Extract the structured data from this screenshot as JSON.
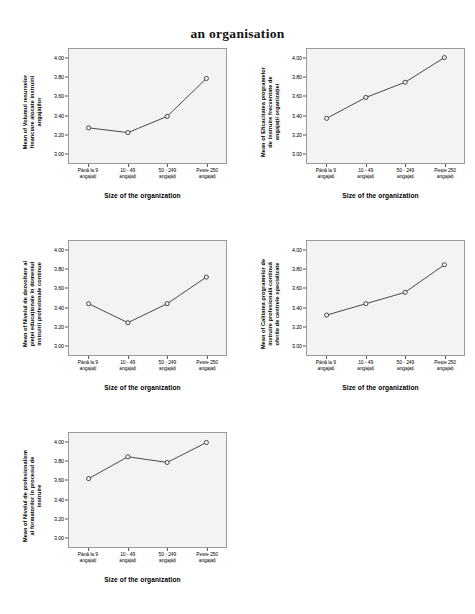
{
  "title": "an organisation",
  "common": {
    "xlabel": "Size of the organization",
    "categories": [
      [
        "Până la 9",
        "angajați"
      ],
      [
        "10 - 49",
        "angajați"
      ],
      [
        "50 - 249",
        "angajați"
      ],
      [
        "Peste 250",
        "angajați"
      ]
    ],
    "categories_flat": [
      "Până la 9 angajați",
      "10 - 49 angajați",
      "50 - 249 angajați",
      "Peste 250 angajați"
    ],
    "yticks": [
      "3.00",
      "3.20",
      "3.40",
      "3.60",
      "3.80",
      "4.00"
    ],
    "ylim": [
      2.9,
      4.1
    ]
  },
  "chart_data": [
    {
      "type": "line",
      "id": "panel-1",
      "title": "",
      "ylabel": "Mean of Volumul resurselor financiare alocate instruirii angajaților",
      "ylabel_lines": [
        "Mean of Volumul resurselor",
        "financiare alocate instruirii",
        "angajaților"
      ],
      "xlabel": "Size of the organization",
      "categories": [
        "Până la 9 angajați",
        "10 - 49 angajați",
        "50 - 249 angajați",
        "Peste 250 angajați"
      ],
      "values": [
        3.27,
        3.22,
        3.39,
        3.79
      ],
      "ylim": [
        2.9,
        4.1
      ],
      "yticks": [
        3.0,
        3.2,
        3.4,
        3.6,
        3.8,
        4.0
      ],
      "grid": false,
      "legend": "none",
      "marker": "open-circle"
    },
    {
      "type": "line",
      "id": "panel-2",
      "title": "",
      "ylabel": "Mean of Eficacitatea programelor de instruire frecventate de angajații organizației",
      "ylabel_lines": [
        "Mean of Eficacitatea programelor",
        "de instruire frecventate de",
        "angajații organizației"
      ],
      "xlabel": "Size of the organization",
      "categories": [
        "Până la 9 angajați",
        "10 - 49 angajați",
        "50 - 249 angajați",
        "Peste 250 angajați"
      ],
      "values": [
        3.37,
        3.59,
        3.75,
        4.01
      ],
      "ylim": [
        2.9,
        4.1
      ],
      "yticks": [
        3.0,
        3.2,
        3.4,
        3.6,
        3.8,
        4.0
      ],
      "grid": false,
      "legend": "none",
      "marker": "open-circle"
    },
    {
      "type": "line",
      "id": "panel-3",
      "title": "",
      "ylabel": "Mean of Nivelul de dezvoltare al pieței educaționale în domeniul instruirii profesionale continue",
      "ylabel_lines": [
        "Mean of Nivelul de dezvoltare al",
        "pieței educaționale în domeniul",
        "instruirii profesionale continue"
      ],
      "xlabel": "Size of the organization",
      "categories": [
        "Până la 9 angajați",
        "10 - 49 angajați",
        "50 - 249 angajați",
        "Peste 250 angajați"
      ],
      "values": [
        3.44,
        3.24,
        3.44,
        3.72
      ],
      "ylim": [
        2.9,
        4.1
      ],
      "yticks": [
        3.0,
        3.2,
        3.4,
        3.6,
        3.8,
        4.0
      ],
      "grid": false,
      "legend": "none",
      "marker": "open-circle"
    },
    {
      "type": "line",
      "id": "panel-4",
      "title": "",
      "ylabel": "Mean of Calitatea programelor de instruire profesională continuă oferite de centrele specializate",
      "ylabel_lines": [
        "Mean of Calitatea programelor de",
        "instruire profesională continuă",
        "oferite de centrele specializate"
      ],
      "xlabel": "Size of the organization",
      "categories": [
        "Până la 9 angajați",
        "10 - 49 angajați",
        "50 - 249 angajați",
        "Peste 250 angajați"
      ],
      "values": [
        3.32,
        3.44,
        3.56,
        3.85
      ],
      "ylim": [
        2.9,
        4.1
      ],
      "yticks": [
        3.0,
        3.2,
        3.4,
        3.6,
        3.8,
        4.0
      ],
      "grid": false,
      "legend": "none",
      "marker": "open-circle"
    },
    {
      "type": "line",
      "id": "panel-5",
      "title": "",
      "ylabel": "Mean of Nivelul de profesionalism al formatorilor în procesul de instruire",
      "ylabel_lines": [
        "Mean of Nivelul de profesionalism",
        "al formatorilor în procesul de",
        "instruire"
      ],
      "xlabel": "Size of the organization",
      "categories": [
        "Până la 9 angajați",
        "10 - 49 angajați",
        "50 - 249 angajați",
        "Peste 250 angajați"
      ],
      "values": [
        3.62,
        3.85,
        3.79,
        4.0
      ],
      "ylim": [
        2.9,
        4.1
      ],
      "yticks": [
        3.0,
        3.2,
        3.4,
        3.6,
        3.8,
        4.0
      ],
      "grid": false,
      "legend": "none",
      "marker": "open-circle"
    }
  ],
  "colors": {
    "line": "#333333",
    "marker_stroke": "#333333",
    "marker_fill": "#f3f3f3",
    "panel_bg": "#f3f3f3",
    "panel_border": "#9a9a9a",
    "text": "#000000"
  }
}
